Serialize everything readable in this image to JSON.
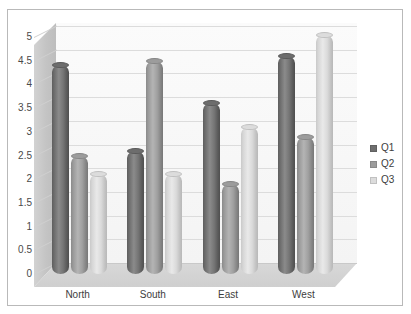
{
  "chart_data": {
    "type": "bar",
    "title": "",
    "xlabel": "",
    "ylabel": "",
    "categories": [
      "North",
      "South",
      "East",
      "West"
    ],
    "series": [
      {
        "name": "Q1",
        "color": "#6e6e6e",
        "values": [
          4.4,
          2.6,
          3.6,
          4.6
        ]
      },
      {
        "name": "Q2",
        "color": "#9c9c9c",
        "values": [
          2.5,
          4.5,
          1.9,
          2.9
        ]
      },
      {
        "name": "Q3",
        "color": "#dcdcdc",
        "values": [
          2.1,
          2.1,
          3.1,
          5.05
        ]
      }
    ],
    "ylim": [
      0,
      5
    ],
    "ytick_values": [
      0,
      0.5,
      1,
      1.5,
      2,
      2.5,
      3,
      3.5,
      4,
      4.5,
      5
    ],
    "ytick_labels": [
      "0",
      "0.5",
      "1",
      "1.5",
      "2",
      "2.5",
      "3",
      "3.5",
      "4",
      "4.5",
      "5"
    ],
    "grid": true,
    "grid_axis": "y",
    "legend_position": "right",
    "style": "3d-cylinder",
    "plot_background": "#fbfbfb",
    "grid_color": "#dcdcdc",
    "border_color": "#b9b9b9"
  }
}
